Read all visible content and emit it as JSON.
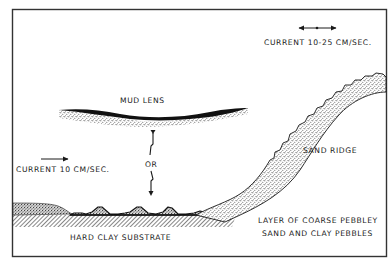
{
  "diagram": {
    "labels": {
      "current_fast": "CURRENT 10-25 CM/SEC.",
      "current_slow": "CURRENT 10 CM/SEC.",
      "mud_lens": "MUD LENS",
      "or": "OR",
      "sand_ridge": "SAND RIDGE",
      "pebble_layer_line1": "LAYER OF COARSE PEBBLEY",
      "pebble_layer_line2": "SAND AND CLAY PEBBLES",
      "substrate": "HARD CLAY SUBSTRATE"
    },
    "colors": {
      "ink": "#1a1a1a",
      "stipple": "#555555",
      "background": "#ffffff",
      "frame": "#333333"
    },
    "icons": {
      "current_fast_arrow": "double-headed-arrow-with-midpoint",
      "current_slow_arrow": "right-arrow",
      "vertical_movement": "zigzag-up-down-arrows"
    }
  }
}
